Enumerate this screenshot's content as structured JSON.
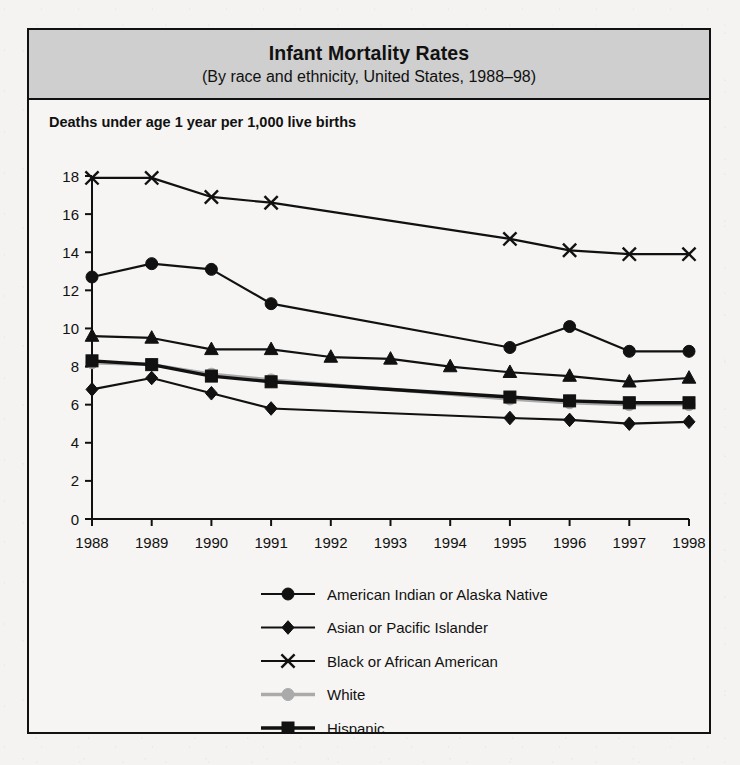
{
  "figure": {
    "title": "Infant Mortality Rates",
    "subtitle": "(By race and ethnicity, United States, 1988–98)",
    "axis_caption": "Deaths under age 1 year per 1,000 live births",
    "banner_color": "#cfcfcf",
    "border_color": "#111111",
    "background_color": "#f6f5f3"
  },
  "chart_data": {
    "type": "line",
    "title": "Infant Mortality Rates",
    "subtitle": "(By race and ethnicity, United States, 1988–98)",
    "xlabel": "",
    "ylabel": "Deaths under age 1 year per 1,000 live births",
    "categories": [
      "1988",
      "1989",
      "1990",
      "1991",
      "1992",
      "1993",
      "1994",
      "1995",
      "1996",
      "1997",
      "1998"
    ],
    "x": [
      1988,
      1989,
      1990,
      1991,
      1992,
      1993,
      1994,
      1995,
      1996,
      1997,
      1998
    ],
    "ylim": [
      0,
      18
    ],
    "yticks": [
      0,
      2,
      4,
      6,
      8,
      10,
      12,
      14,
      16,
      18
    ],
    "grid": false,
    "legend_position": "bottom-center",
    "series": [
      {
        "name": "American Indian or Alaska Native",
        "marker": "circle",
        "color": "#111111",
        "values": [
          12.7,
          13.4,
          13.1,
          11.3,
          null,
          null,
          null,
          9.0,
          10.1,
          8.8,
          8.8
        ]
      },
      {
        "name": "Asian or Pacific Islander",
        "marker": "diamond",
        "color": "#111111",
        "values": [
          6.8,
          7.4,
          6.6,
          5.8,
          null,
          null,
          null,
          5.3,
          5.2,
          5.0,
          5.1
        ]
      },
      {
        "name": "Black or African American",
        "marker": "cross",
        "color": "#111111",
        "values": [
          17.9,
          17.9,
          16.9,
          16.6,
          null,
          null,
          null,
          14.7,
          14.1,
          13.9,
          13.9
        ]
      },
      {
        "name": "White",
        "marker": "circle-gray",
        "color": "#aaaaaa",
        "values": [
          8.2,
          8.1,
          7.6,
          7.3,
          null,
          null,
          null,
          6.3,
          6.1,
          6.0,
          6.0
        ]
      },
      {
        "name": "Hispanic",
        "marker": "square",
        "color": "#111111",
        "values": [
          8.3,
          8.1,
          7.5,
          7.2,
          null,
          null,
          null,
          6.4,
          6.2,
          6.1,
          6.1
        ]
      },
      {
        "name": "Total",
        "marker": "triangle",
        "color": "#111111",
        "values": [
          9.6,
          9.5,
          8.9,
          8.9,
          8.5,
          8.4,
          8.0,
          7.7,
          7.5,
          7.2,
          7.4
        ]
      }
    ]
  }
}
